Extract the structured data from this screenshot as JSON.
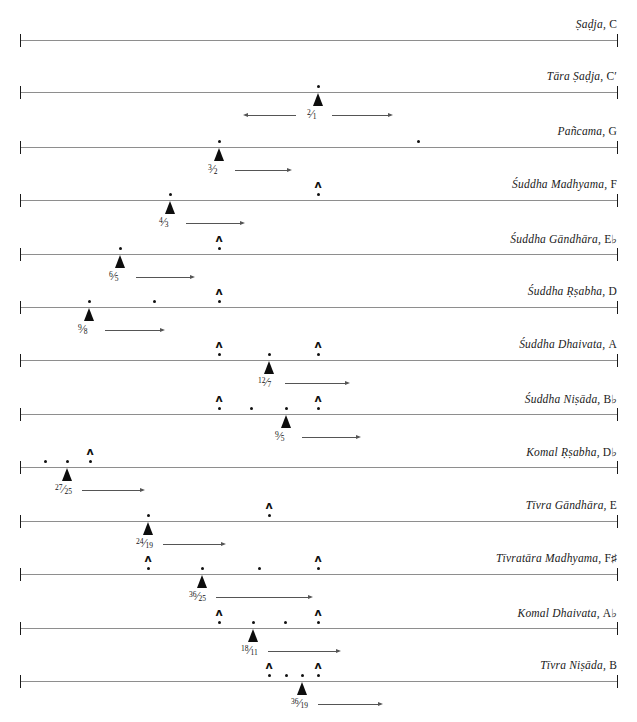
{
  "figure": {
    "type": "interval-chart",
    "axis": {
      "x_start": 20,
      "x_end": 617,
      "left_cap": "|",
      "right_cap": "|"
    },
    "marker_glyphs": {
      "caret": "ʌ",
      "dot": "dot-marker",
      "triangle": "triangle-marker"
    },
    "rows": [
      {
        "name": "Ṣaḍja, C",
        "label_main": "Ṣaḍja",
        "label_pitch": "C",
        "axis_y": 40,
        "ratio": null,
        "ratio_num": null,
        "ratio_den": null,
        "arrow": null,
        "markers": []
      },
      {
        "name": "Tāra Ṣaḍja, C′",
        "label_main": "Tāra Ṣaḍja",
        "label_pitch": "C′",
        "axis_y": 92,
        "ratio": "2/1",
        "ratio_num": "2",
        "ratio_den": "1",
        "arrow": {
          "x1": 248,
          "x2": 388,
          "double": true,
          "label_x": 318
        },
        "markers": [
          {
            "kind": "triangle-dot",
            "x": 318
          }
        ]
      },
      {
        "name": "Pañcama, G",
        "label_main": "Pañcama",
        "label_pitch": "G",
        "axis_y": 147,
        "ratio": "3/2",
        "ratio_num": "3",
        "ratio_den": "2",
        "arrow": {
          "x1": 231,
          "x2": 287,
          "double": false,
          "label_x": 219
        },
        "markers": [
          {
            "kind": "triangle-dot",
            "x": 219
          },
          {
            "kind": "dot",
            "x": 418
          }
        ]
      },
      {
        "name": "Śuddha Madhyama, F",
        "label_main": "Śuddha Madhyama",
        "label_pitch": "F",
        "axis_y": 200,
        "ratio": "4/3",
        "ratio_num": "4",
        "ratio_den": "3",
        "arrow": {
          "x1": 184,
          "x2": 240,
          "double": false,
          "label_x": 170
        },
        "markers": [
          {
            "kind": "triangle-dot",
            "x": 170
          },
          {
            "kind": "caret-dot",
            "x": 318
          }
        ]
      },
      {
        "name": "Śuddha Gāndhāra, E♭",
        "label_main": "Śuddha Gāndhāra",
        "label_pitch": "E♭",
        "axis_y": 254,
        "ratio": "6/5",
        "ratio_num": "6",
        "ratio_den": "5",
        "arrow": {
          "x1": 134,
          "x2": 190,
          "double": false,
          "label_x": 120
        },
        "markers": [
          {
            "kind": "triangle-dot",
            "x": 120
          },
          {
            "kind": "caret-dot",
            "x": 219
          }
        ]
      },
      {
        "name": "Śuddha Ṛṣabha, D",
        "label_main": "Śuddha Ṛṣabha",
        "label_pitch": "D",
        "axis_y": 307,
        "ratio": "9/8",
        "ratio_num": "9",
        "ratio_den": "8",
        "arrow": {
          "x1": 103,
          "x2": 160,
          "double": false,
          "label_x": 89
        },
        "markers": [
          {
            "kind": "triangle-dot",
            "x": 89
          },
          {
            "kind": "dot",
            "x": 154
          },
          {
            "kind": "caret-dot",
            "x": 219
          }
        ]
      },
      {
        "name": "Śuddha Dhaivata, A",
        "label_main": "Śuddha Dhaivata",
        "label_pitch": "A",
        "axis_y": 360,
        "ratio": "12/7",
        "ratio_num": "12",
        "ratio_den": "7",
        "arrow": {
          "x1": 288,
          "x2": 345,
          "double": false,
          "label_x": 269
        },
        "markers": [
          {
            "kind": "caret-dot",
            "x": 219
          },
          {
            "kind": "triangle-dot",
            "x": 269
          },
          {
            "kind": "caret-dot",
            "x": 318
          }
        ]
      },
      {
        "name": "Śuddha Niṣāda, B♭",
        "label_main": "Śuddha Niṣāda",
        "label_pitch": "B♭",
        "axis_y": 414,
        "ratio": "9/5",
        "ratio_num": "9",
        "ratio_den": "5",
        "arrow": {
          "x1": 300,
          "x2": 356,
          "double": false,
          "label_x": 286
        },
        "markers": [
          {
            "kind": "caret-dot",
            "x": 219
          },
          {
            "kind": "dot",
            "x": 251
          },
          {
            "kind": "triangle-dot",
            "x": 286
          },
          {
            "kind": "caret-dot",
            "x": 318
          }
        ]
      },
      {
        "name": "Komal Ṛṣabha, D♭",
        "label_main": "Komal Ṛṣabha",
        "label_pitch": "D♭",
        "axis_y": 467,
        "ratio": "27/25",
        "ratio_num": "27",
        "ratio_den": "25",
        "arrow": {
          "x1": 82,
          "x2": 140,
          "double": false,
          "label_x": 66
        },
        "markers": [
          {
            "kind": "dot",
            "x": 45
          },
          {
            "kind": "triangle-dot",
            "x": 67
          },
          {
            "kind": "caret-dot",
            "x": 90
          }
        ]
      },
      {
        "name": "Tīvra Gāndhāra, E",
        "label_main": "Tīvra Gāndhāra",
        "label_pitch": "E",
        "axis_y": 521,
        "ratio": "24/19",
        "ratio_num": "24",
        "ratio_den": "19",
        "arrow": {
          "x1": 163,
          "x2": 221,
          "double": false,
          "label_x": 147
        },
        "markers": [
          {
            "kind": "triangle-dot",
            "x": 148
          },
          {
            "kind": "caret-dot",
            "x": 269
          }
        ]
      },
      {
        "name": "Tīvratāra Madhyama, F♯",
        "label_main": "Tīvratāra Madhyama",
        "label_pitch": "F♯",
        "axis_y": 574,
        "ratio": "36/25",
        "ratio_num": "36",
        "ratio_den": "25",
        "arrow": {
          "x1": 217,
          "x2": 308,
          "double": false,
          "label_x": 200
        },
        "markers": [
          {
            "kind": "caret-dot",
            "x": 148
          },
          {
            "kind": "triangle-dot",
            "x": 202
          },
          {
            "kind": "dot",
            "x": 259
          },
          {
            "kind": "caret-dot",
            "x": 318
          }
        ]
      },
      {
        "name": "Komal Dhaivata, A♭",
        "label_main": "Komal Dhaivata",
        "label_pitch": "A♭",
        "axis_y": 628,
        "ratio": "18/11",
        "ratio_num": "18",
        "ratio_den": "11",
        "arrow": {
          "x1": 268,
          "x2": 336,
          "double": false,
          "label_x": 252
        },
        "markers": [
          {
            "kind": "caret-dot",
            "x": 219
          },
          {
            "kind": "triangle-dot",
            "x": 253
          },
          {
            "kind": "dot",
            "x": 285
          },
          {
            "kind": "caret-dot",
            "x": 318
          }
        ]
      },
      {
        "name": "Tīvra Niṣāda, B",
        "label_main": "Tīvra Niṣāda",
        "label_pitch": "B",
        "axis_y": 681,
        "ratio": "36/19",
        "ratio_num": "36",
        "ratio_den": "19",
        "arrow": {
          "x1": 318,
          "x2": 378,
          "double": false,
          "label_x": 302
        },
        "markers": [
          {
            "kind": "caret-dot",
            "x": 269
          },
          {
            "kind": "dot",
            "x": 286
          },
          {
            "kind": "triangle-dot",
            "x": 302
          },
          {
            "kind": "caret-dot",
            "x": 318
          }
        ]
      }
    ]
  }
}
